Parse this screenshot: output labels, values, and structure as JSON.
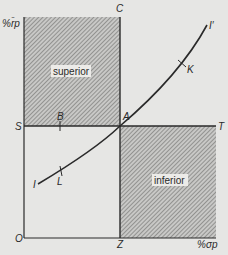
{
  "diagram": {
    "axes": {
      "y_label": "%r̄p",
      "x_label": "%σp",
      "origin": "O"
    },
    "points": {
      "C": "C",
      "S": "S",
      "T": "T",
      "Z": "Z",
      "A": "A",
      "B": "B",
      "K": "K",
      "L": "L",
      "I": "I",
      "I_prime": "I′"
    },
    "regions": {
      "upper_left": "superior",
      "lower_right": "inferior"
    },
    "colors": {
      "background": "#e6e6e4",
      "line": "#2a2a2a",
      "hatch_bg": "#c8c8c6",
      "hatch_line": "#6e6e6c",
      "label_bg": "#ecebe8"
    }
  }
}
